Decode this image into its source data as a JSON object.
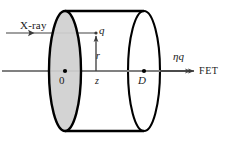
{
  "figure": {
    "labels": {
      "xray": "X-ray",
      "charge": "q",
      "radius": "r",
      "origin": "0",
      "depth": "z",
      "thickness": "D",
      "induced_charge": "ηq",
      "readout": "FET"
    },
    "colors": {
      "outline": "#000000",
      "front_face_fill": "#cfcfcf",
      "back_face_fill": "#ffffff",
      "axis_line": "#808080",
      "annotation_line": "#3a3a3a",
      "text": "#1a1a1a",
      "background": "#ffffff"
    },
    "geometry": {
      "front_face_center_x": 65,
      "back_face_center_x": 144,
      "axis_y": 71,
      "ellipse_rx": 16,
      "ellipse_ry": 60,
      "charge_x": 96,
      "charge_y": 33,
      "xray_start_x": 6,
      "axis_start_x": 2,
      "axis_end_x": 196
    }
  }
}
